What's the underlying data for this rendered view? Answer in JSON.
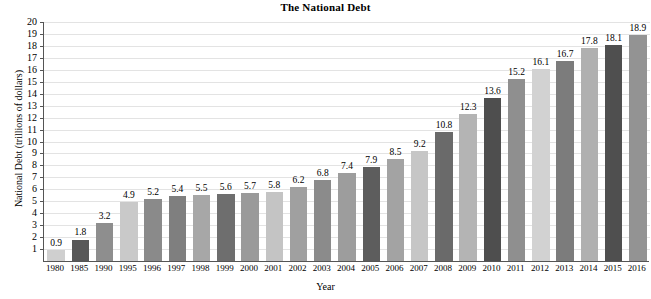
{
  "chart_data": {
    "type": "bar",
    "title": "The National Debt",
    "xlabel": "Year",
    "ylabel": "National Debt (trillions of dollars)",
    "ylim": [
      0,
      20
    ],
    "ytick_step": 1,
    "grid": true,
    "legend": "none",
    "categories": [
      "1980",
      "1985",
      "1990",
      "1995",
      "1996",
      "1997",
      "1998",
      "1999",
      "2000",
      "2001",
      "2002",
      "2003",
      "2004",
      "2005",
      "2006",
      "2007",
      "2008",
      "2009",
      "2010",
      "2011",
      "2012",
      "2013",
      "2014",
      "2015",
      "2016"
    ],
    "values": [
      0.9,
      1.8,
      3.2,
      4.9,
      5.2,
      5.4,
      5.5,
      5.6,
      5.7,
      5.8,
      6.2,
      6.8,
      7.4,
      7.9,
      8.5,
      9.2,
      10.8,
      12.3,
      13.6,
      15.2,
      16.1,
      16.7,
      17.8,
      18.1,
      18.9
    ],
    "data_labels": [
      "0.9",
      "1.8",
      "3.2",
      "4.9",
      "5.2",
      "5.4",
      "5.5",
      "5.6",
      "5.7",
      "5.8",
      "6.2",
      "6.8",
      "7.4",
      "7.9",
      "8.5",
      "9.2",
      "10.8",
      "12.3",
      "13.6",
      "15.2",
      "16.1",
      "16.7",
      "17.8",
      "18.1",
      "18.9"
    ],
    "ytick_labels": [
      "20",
      "19",
      "18",
      "17",
      "16",
      "15",
      "14",
      "13",
      "12",
      "11",
      "10",
      "9",
      "8",
      "7",
      "6",
      "5",
      "4",
      "3",
      "2",
      "1"
    ],
    "bar_colors": [
      "#cfcfcf",
      "#585858",
      "#8e8e8e",
      "#c9c9c9",
      "#8a8a8a",
      "#7f7f7f",
      "#a7a7a7",
      "#6e6e6e",
      "#9a9a9a",
      "#c4c4c4",
      "#a0a0a0",
      "#8b8b8b",
      "#9d9d9d",
      "#5d5d5d",
      "#a3a3a3",
      "#c6c6c6",
      "#6a6a6a",
      "#b4b4b4",
      "#4e4e4e",
      "#8f8f8f",
      "#d2d2d2",
      "#7c7c7c",
      "#b0b0b0",
      "#4f4f4f",
      "#939393"
    ],
    "grid_color": "#e3e3e3",
    "axis_color": "#555555",
    "text_color": "#000000"
  }
}
